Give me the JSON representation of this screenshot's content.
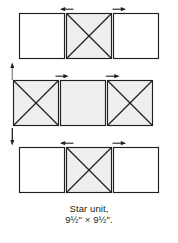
{
  "figure": {
    "kind": "quilt-piecing-diagram",
    "caption": {
      "line1": "Star unit,",
      "line2_size": "9½\" × 9½\"."
    },
    "colors": {
      "outline": "#231f20",
      "shaded_fill": "#eeeeee",
      "plain_fill": "#ffffff",
      "arrow": "#231f20",
      "background": "#ffffff",
      "caption_text": "#231f20"
    },
    "rows": [
      {
        "name": "top-row",
        "label": "Top row",
        "blocks": [
          {
            "name": "plain-square",
            "pattern": "plain",
            "fill": "#ffffff"
          },
          {
            "name": "hourglass-square",
            "pattern": "x-diagonals",
            "fill": "#eeeeee"
          },
          {
            "name": "plain-square",
            "pattern": "plain",
            "fill": "#ffffff"
          }
        ]
      },
      {
        "name": "middle-row",
        "label": "Middle row",
        "blocks": [
          {
            "name": "hourglass-square",
            "pattern": "x-diagonals",
            "fill": "#eeeeee"
          },
          {
            "name": "plain-square",
            "pattern": "plain",
            "fill": "#eeeeee"
          },
          {
            "name": "hourglass-square",
            "pattern": "x-diagonals",
            "fill": "#eeeeee"
          }
        ]
      },
      {
        "name": "bottom-row",
        "label": "Bottom row",
        "blocks": [
          {
            "name": "plain-square",
            "pattern": "plain",
            "fill": "#ffffff"
          },
          {
            "name": "hourglass-square",
            "pattern": "x-diagonals",
            "fill": "#eeeeee"
          },
          {
            "name": "plain-square",
            "pattern": "plain",
            "fill": "#ffffff"
          }
        ]
      }
    ],
    "arrows": [
      {
        "name": "seam-arrow-top-left",
        "direction": "left",
        "row": "top-row",
        "edge": "top"
      },
      {
        "name": "seam-arrow-top-right",
        "direction": "right",
        "row": "top-row",
        "edge": "top"
      },
      {
        "name": "seam-arrow-row-join-up",
        "direction": "up",
        "row": "top-row",
        "edge": "left"
      },
      {
        "name": "seam-arrow-middle-left",
        "direction": "right",
        "row": "middle-row",
        "edge": "top"
      },
      {
        "name": "seam-arrow-middle-right",
        "direction": "left",
        "row": "middle-row",
        "edge": "top"
      },
      {
        "name": "seam-arrow-row-join-down",
        "direction": "down",
        "row": "bottom-row",
        "edge": "left"
      },
      {
        "name": "seam-arrow-bottom-left",
        "direction": "left",
        "row": "bottom-row",
        "edge": "top"
      },
      {
        "name": "seam-arrow-bottom-right",
        "direction": "right",
        "row": "bottom-row",
        "edge": "top"
      }
    ]
  }
}
